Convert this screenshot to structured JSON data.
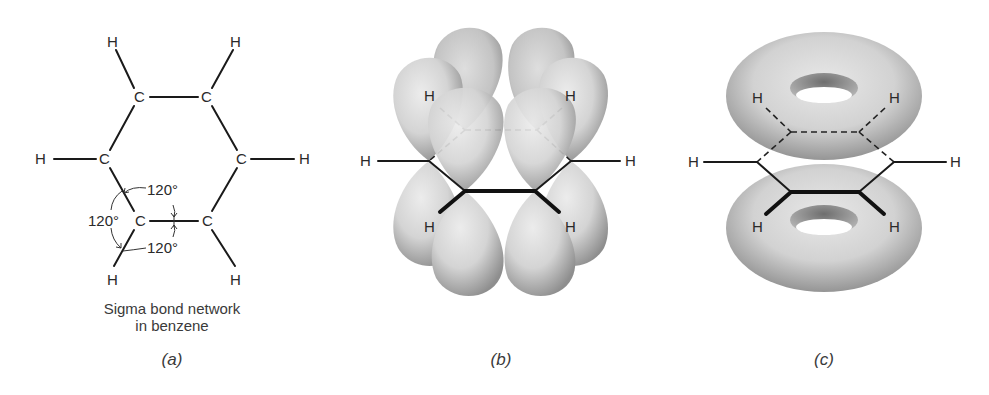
{
  "figure": {
    "panels": [
      {
        "id": "a",
        "label": "(a)",
        "caption_line1": "Sigma bond network",
        "caption_line2": "in benzene",
        "atoms": {
          "h_top_left": "H",
          "h_top_right": "H",
          "c_top_left": "C",
          "c_top_right": "C",
          "h_left": "H",
          "c_left": "C",
          "c_right": "C",
          "h_right": "H",
          "c_bottom_left": "C",
          "c_bottom_right": "C",
          "h_bottom_left": "H",
          "h_bottom_right": "H"
        },
        "angles": [
          "120°",
          "120°",
          "120°"
        ]
      },
      {
        "id": "b",
        "label": "(b)",
        "description": "p orbitals above and below the benzene ring",
        "atoms": [
          "H",
          "H",
          "H",
          "H",
          "H",
          "H"
        ]
      },
      {
        "id": "c",
        "label": "(c)",
        "description": "delocalized pi electron clouds (toroids) above and below the ring",
        "atoms": [
          "H",
          "H",
          "H",
          "H",
          "H",
          "H"
        ]
      }
    ],
    "colors": {
      "line": "#1a1a1a",
      "orbital_light": "#e2e2e2",
      "orbital_dark": "#9a9a9a",
      "background": "#ffffff"
    }
  }
}
